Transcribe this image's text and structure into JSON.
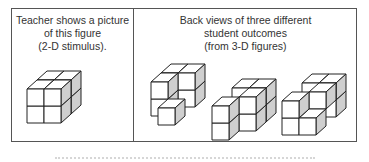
{
  "panels": {
    "left": {
      "caption_lines": [
        "Teacher shows a picture",
        "of this figure",
        "(2-D stimulus)."
      ]
    },
    "right": {
      "caption_lines": [
        "Back views of three different",
        "student outcomes",
        "(from 3-D figures)"
      ]
    }
  },
  "colors": {
    "stroke": "#222222",
    "front": "#ffffff",
    "top": "#ffffff",
    "side": "#cfcfcf",
    "frame": "#555555"
  },
  "cube": {
    "size": 17,
    "dx": 10,
    "dy": 9
  },
  "figures": [
    {
      "name": "teacher-figure",
      "origin": [
        27,
        123
      ],
      "cubes": [
        [
          0,
          0,
          1
        ],
        [
          1,
          0,
          1
        ],
        [
          0,
          1,
          1
        ],
        [
          1,
          1,
          1
        ],
        [
          0,
          0,
          0
        ],
        [
          1,
          0,
          0
        ],
        [
          0,
          1,
          0
        ],
        [
          1,
          1,
          0
        ]
      ]
    },
    {
      "name": "student-outcome-1",
      "origin": [
        151,
        116
      ],
      "cubes": [
        [
          0,
          0,
          1
        ],
        [
          1,
          0,
          1
        ],
        [
          0,
          1,
          1
        ],
        [
          1,
          1,
          1
        ],
        [
          0,
          0,
          0
        ],
        [
          0,
          1,
          0
        ],
        [
          1,
          0,
          -1
        ]
      ]
    },
    {
      "name": "student-outcome-2",
      "origin": [
        222,
        131
      ],
      "cubes": [
        [
          0,
          0,
          1
        ],
        [
          1,
          0,
          1
        ],
        [
          0,
          1,
          1
        ],
        [
          1,
          1,
          1
        ],
        [
          1,
          0,
          0
        ],
        [
          1,
          1,
          0
        ],
        [
          0,
          0,
          -1
        ],
        [
          0,
          1,
          -1
        ]
      ]
    },
    {
      "name": "student-outcome-3",
      "origin": [
        292,
        126
      ],
      "cubes": [
        [
          0,
          0,
          1
        ],
        [
          1,
          0,
          1
        ],
        [
          1,
          1,
          1
        ],
        [
          0,
          1,
          1
        ],
        [
          1,
          1,
          0
        ],
        [
          0,
          0,
          -1
        ],
        [
          1,
          0,
          -1
        ],
        [
          0,
          1,
          -1
        ]
      ]
    }
  ],
  "footer": {
    "caption_visible": "partially cut off"
  }
}
